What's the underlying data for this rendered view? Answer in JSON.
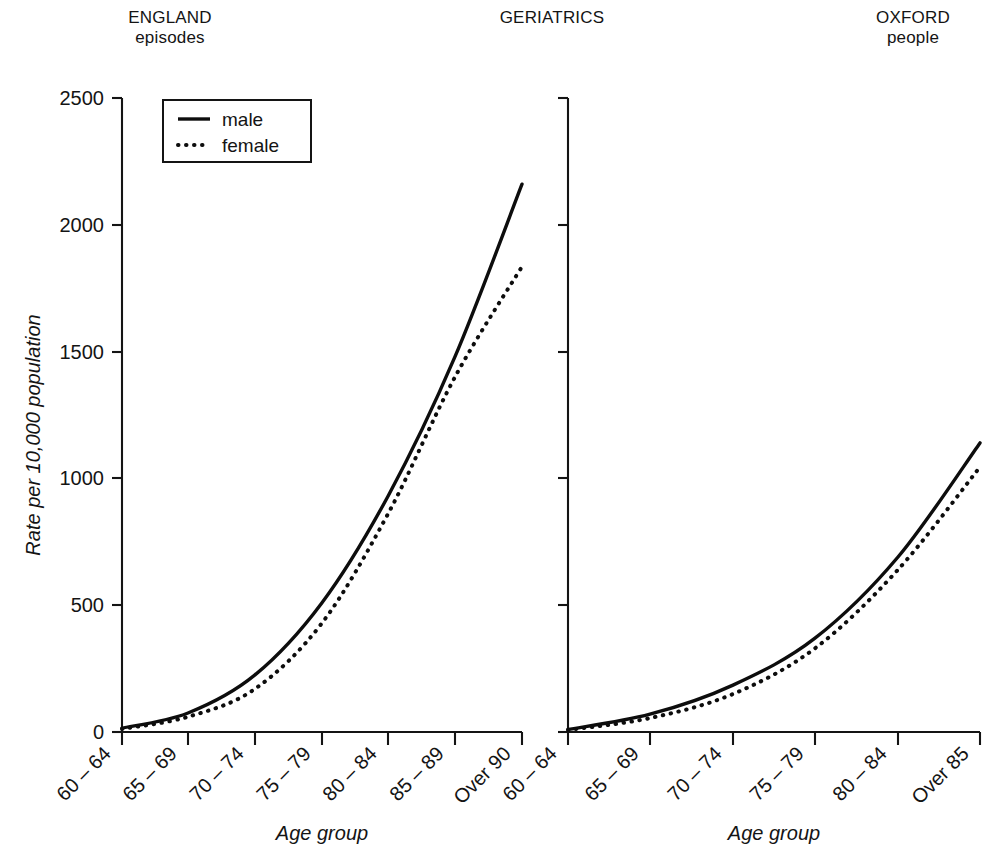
{
  "headers": {
    "left": {
      "title": "ENGLAND",
      "subtitle": "episodes"
    },
    "middle": {
      "title": "GERIATRICS",
      "subtitle": ""
    },
    "right": {
      "title": "OXFORD",
      "subtitle": "people"
    }
  },
  "legend": {
    "male_label": "male",
    "female_label": "female"
  },
  "axes": {
    "ylabel": "Rate per 10,000 population",
    "xlabel": "Age group",
    "yticks": [
      "0",
      "500",
      "1000",
      "1500",
      "2000",
      "2500"
    ]
  },
  "chart_data": [
    {
      "type": "line",
      "title": "ENGLAND episodes",
      "panel": "left",
      "xlabel": "Age group",
      "ylabel": "Rate per 10,000 population",
      "categories": [
        "60 – 64",
        "65 – 69",
        "70 – 74",
        "75 – 79",
        "80 – 84",
        "85 – 89",
        "Over 90"
      ],
      "ylim": [
        0,
        2500
      ],
      "yticks": [
        0,
        500,
        1000,
        1500,
        2000,
        2500
      ],
      "grid": false,
      "legend_position": "top-left",
      "series": [
        {
          "name": "male",
          "values": [
            15,
            75,
            225,
            510,
            930,
            1480,
            2160
          ]
        },
        {
          "name": "female",
          "values": [
            12,
            60,
            170,
            430,
            860,
            1400,
            1835
          ]
        }
      ]
    },
    {
      "type": "line",
      "title": "OXFORD people",
      "panel": "right",
      "xlabel": "Age group",
      "ylabel": "Rate per 10,000 population",
      "categories": [
        "60 – 64",
        "65 – 69",
        "70 – 74",
        "75 – 79",
        "80 – 84",
        "Over 85"
      ],
      "ylim": [
        0,
        2500
      ],
      "yticks": [
        0,
        500,
        1000,
        1500,
        2000,
        2500
      ],
      "grid": false,
      "legend_position": "none",
      "series": [
        {
          "name": "male",
          "values": [
            10,
            70,
            185,
            370,
            690,
            1140
          ]
        },
        {
          "name": "female",
          "values": [
            8,
            55,
            150,
            330,
            640,
            1045
          ]
        }
      ]
    }
  ],
  "left_panel": {
    "xticklabels": [
      "60 – 64",
      "65 – 69",
      "70 – 74",
      "75 – 79",
      "80 – 84",
      "85 – 89",
      "Over 90"
    ],
    "xlabel": "Age group"
  },
  "right_panel": {
    "xticklabels": [
      "60 – 64",
      "65 – 69",
      "70 – 74",
      "75 – 79",
      "80 – 84",
      "Over 85"
    ],
    "xlabel": "Age group"
  }
}
